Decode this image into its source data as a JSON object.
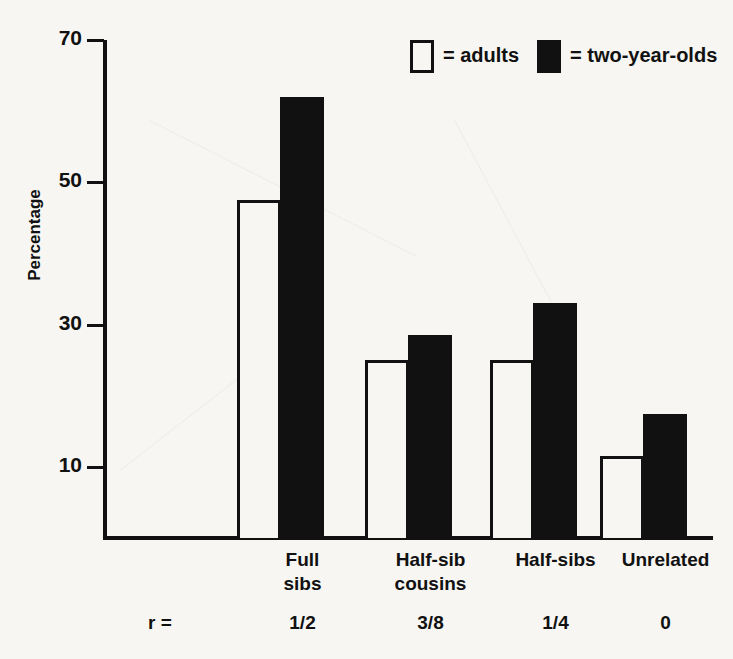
{
  "chart_data": {
    "type": "bar",
    "title": "",
    "xlabel": "",
    "ylabel": "Percentage",
    "ylim": [
      0,
      70
    ],
    "yticks": [
      10,
      30,
      50,
      70
    ],
    "ytick_labels": [
      "10",
      "30",
      "50",
      "70"
    ],
    "grid": false,
    "legend_position": "top-right",
    "categories": [
      "Full\nsibs",
      "Half-sib\ncousins",
      "Half-sibs",
      "Unrelated"
    ],
    "category_lines": [
      [
        "Full",
        "sibs"
      ],
      [
        "Half-sib",
        "cousins"
      ],
      [
        "Half-sibs"
      ],
      [
        "Unrelated"
      ]
    ],
    "secondary_axis_label": "r =",
    "secondary_axis_values": [
      "1/2",
      "3/8",
      "1/4",
      "0"
    ],
    "series": [
      {
        "name": "adults",
        "swatch": "open",
        "values": [
          47.5,
          25.0,
          25.0,
          11.5
        ]
      },
      {
        "name": "two-year-olds",
        "swatch": "filled",
        "values": [
          62.0,
          28.5,
          33.0,
          17.5
        ]
      }
    ],
    "legend": [
      {
        "marker": "open-square",
        "equals": "=",
        "label": "adults"
      },
      {
        "marker": "filled-square",
        "equals": "=",
        "label": "two-year-olds"
      }
    ],
    "colors": {
      "adults_fill": "#f7f6f3",
      "adults_stroke": "#111111",
      "two_year_olds_fill": "#111111",
      "axis": "#111111",
      "background": "#f7f6f3"
    }
  },
  "legend_entries": {
    "adults_equals": "= adults",
    "twoyear_equals": "= two-year-olds"
  }
}
